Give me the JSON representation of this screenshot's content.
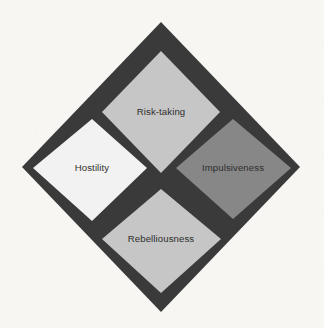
{
  "figure": {
    "shape": "diamond",
    "background_color": "#f7f6f3",
    "border_color": "#3a3a3a",
    "label_color": "#2e2e2e",
    "outer": {
      "top": [
        161,
        22
      ],
      "right": [
        300,
        167
      ],
      "bottom": [
        161,
        312
      ],
      "left": [
        22,
        167
      ]
    },
    "quadrants": [
      {
        "position": "top",
        "label": "Risk-taking",
        "fill": "#c6c6c6",
        "center": [
          161,
          98
        ],
        "vertices": [
          [
            161,
            51
          ],
          [
            219,
            112
          ],
          [
            161,
            173
          ],
          [
            103,
            112
          ]
        ]
      },
      {
        "position": "right",
        "label": "Impulsiveness",
        "fill": "#878787",
        "center": [
          233,
          168
        ],
        "vertices": [
          [
            233,
            120
          ],
          [
            290,
            168
          ],
          [
            233,
            218
          ],
          [
            177,
            168
          ]
        ]
      },
      {
        "position": "bottom",
        "label": "Rebelliousness",
        "fill": "#c6c6c6",
        "center": [
          161,
          238
        ],
        "vertices": [
          [
            161,
            190
          ],
          [
            219,
            238
          ],
          [
            161,
            292
          ],
          [
            103,
            238
          ]
        ]
      },
      {
        "position": "left",
        "label": "Hostility",
        "fill": "#f2f2f2",
        "center": [
          92,
          168
        ],
        "vertices": [
          [
            92,
            120
          ],
          [
            146,
            168
          ],
          [
            92,
            220
          ],
          [
            35,
            168
          ]
        ]
      }
    ]
  }
}
